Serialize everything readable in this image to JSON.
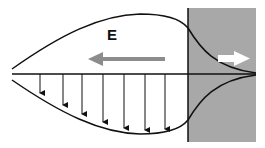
{
  "diagram": {
    "field_label": "E",
    "colors": {
      "background": "#ffffff",
      "medium_fill": "#a8a8a8",
      "line": "#111111",
      "field_arrow": "#8c8c8c",
      "transmitted_arrow": "#ffffff"
    },
    "down_arrows_x": [
      40,
      63,
      82,
      103,
      124,
      145,
      165
    ]
  }
}
